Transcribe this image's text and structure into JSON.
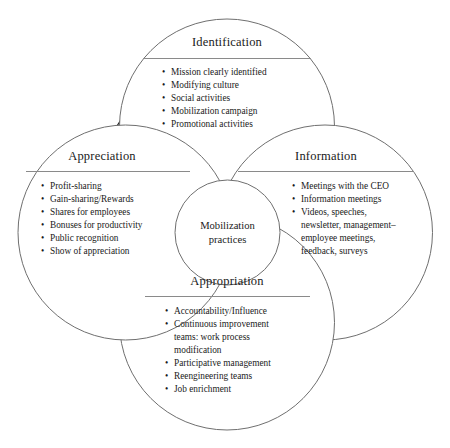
{
  "diagram": {
    "colors": {
      "arrow_fill": "#b2b2b2",
      "arrow_stroke": "#1a1a1a",
      "circle_stroke": "#6f6f6f",
      "text": "#1a1a1a",
      "background": "#ffffff"
    },
    "center": {
      "label_line1": "Mobilization",
      "label_line2": "practices"
    },
    "nodes": [
      {
        "id": "identification",
        "title": "Identification",
        "position": "top",
        "items": [
          "Mission clearly identified",
          "Modifying culture",
          "Social activities",
          "Mobilization campaign",
          "Promotional activities"
        ]
      },
      {
        "id": "information",
        "title": "Information",
        "position": "right",
        "items": [
          "Meetings with the CEO",
          "Information meetings",
          "Videos, speeches,",
          "newsletter, management–",
          "employee meetings,",
          "feedback, surveys"
        ],
        "continuation_indices": [
          3,
          4,
          5
        ]
      },
      {
        "id": "appropriation",
        "title": "Appropriation",
        "position": "bottom",
        "items": [
          "Accountability/Influence",
          "Continuous improvement",
          "teams: work process",
          "modification",
          "Participative management",
          "Reengineering teams",
          "Job enrichment"
        ],
        "continuation_indices": [
          2,
          3
        ]
      },
      {
        "id": "appreciation",
        "title": "Appreciation",
        "position": "left",
        "items": [
          "Profit-sharing",
          "Gain-sharing/Rewards",
          "Shares for employees",
          "Bonuses for productivity",
          "Public recognition",
          "Show of appreciation"
        ]
      }
    ],
    "arrows": [
      {
        "id": "arrow-appreciation-to-identification",
        "direction": "up-right",
        "from": "appreciation",
        "to": "identification"
      },
      {
        "id": "arrow-identification-to-information",
        "direction": "down-right",
        "from": "identification",
        "to": "information"
      },
      {
        "id": "arrow-information-to-appropriation",
        "direction": "down-left",
        "from": "information",
        "to": "appropriation"
      },
      {
        "id": "arrow-appropriation-to-appreciation",
        "direction": "up-left",
        "from": "appropriation",
        "to": "appreciation"
      }
    ]
  }
}
